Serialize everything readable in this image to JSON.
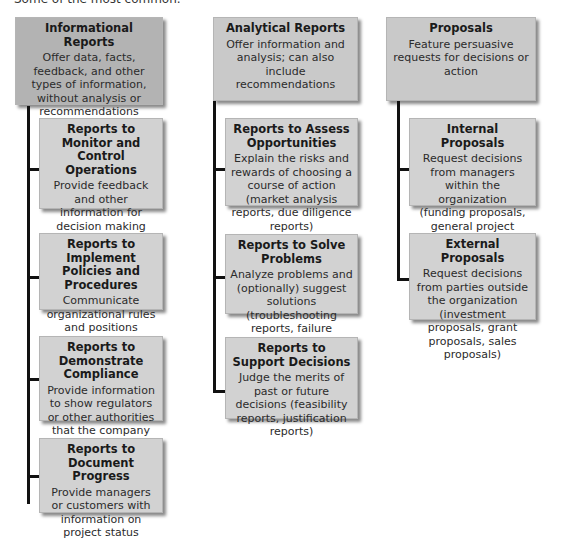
{
  "header": {
    "cut_text": "Some of the most common."
  },
  "columns": [
    {
      "title": "Informational Reports",
      "description": "Offer data, facts, feedback, and other types of information, without analysis or recommendations",
      "children": [
        {
          "title": "Reports to Monitor and Control Operations",
          "description": "Provide feedback and other information for decision making (plans, operating reports, personal activity reports)"
        },
        {
          "title": "Reports to Implement Policies and Procedures",
          "description": "Communicate organizational rules and positions (guidelines, position papers)"
        },
        {
          "title": "Reports to Demonstrate Compliance",
          "description": "Provide information to show regulators or other authorities that the company meets formal requirements"
        },
        {
          "title": "Reports to Document Progress",
          "description": "Provide managers or customers with information on project status"
        }
      ]
    },
    {
      "title": "Analytical Reports",
      "description": "Offer information and analysis; can also include recommendations",
      "children": [
        {
          "title": "Reports to Assess Opportunities",
          "description": "Explain the risks and rewards of choosing a course of action (market analysis reports, due diligence reports)"
        },
        {
          "title": "Reports to Solve Problems",
          "description": "Analyze problems and (optionally) suggest solutions (troubleshooting reports, failure analysis reports)"
        },
        {
          "title": "Reports to Support Decisions",
          "description": "Judge the merits of past or future decisions (feasibility reports, justification reports)"
        }
      ]
    },
    {
      "title": "Proposals",
      "description": "Feature persuasive requests for decisions or action",
      "children": [
        {
          "title": "Internal Proposals",
          "description": "Request decisions from managers within the organization (funding proposals, general project proposals)"
        },
        {
          "title": "External Proposals",
          "description": "Request decisions from parties outside the organization (investment proposals, grant proposals, sales proposals)"
        }
      ]
    }
  ],
  "colors": {
    "top_box": "#b3b3b3",
    "child_box": "#d2d2d2",
    "connector": "#111111"
  }
}
